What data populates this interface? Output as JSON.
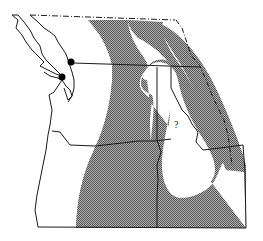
{
  "map": {
    "type": "range-distribution-map",
    "region": "Pacific Northwest",
    "colors": {
      "range_fill": "#8a8a8a",
      "border": "#1a1a1a",
      "background": "#ffffff",
      "locality_dot": "#000000"
    },
    "annotations": [
      {
        "label": "?",
        "x": 176,
        "y": 124
      }
    ],
    "locality_points": [
      {
        "x": 71,
        "y": 62
      },
      {
        "x": 62,
        "y": 77
      }
    ],
    "legend": null
  }
}
